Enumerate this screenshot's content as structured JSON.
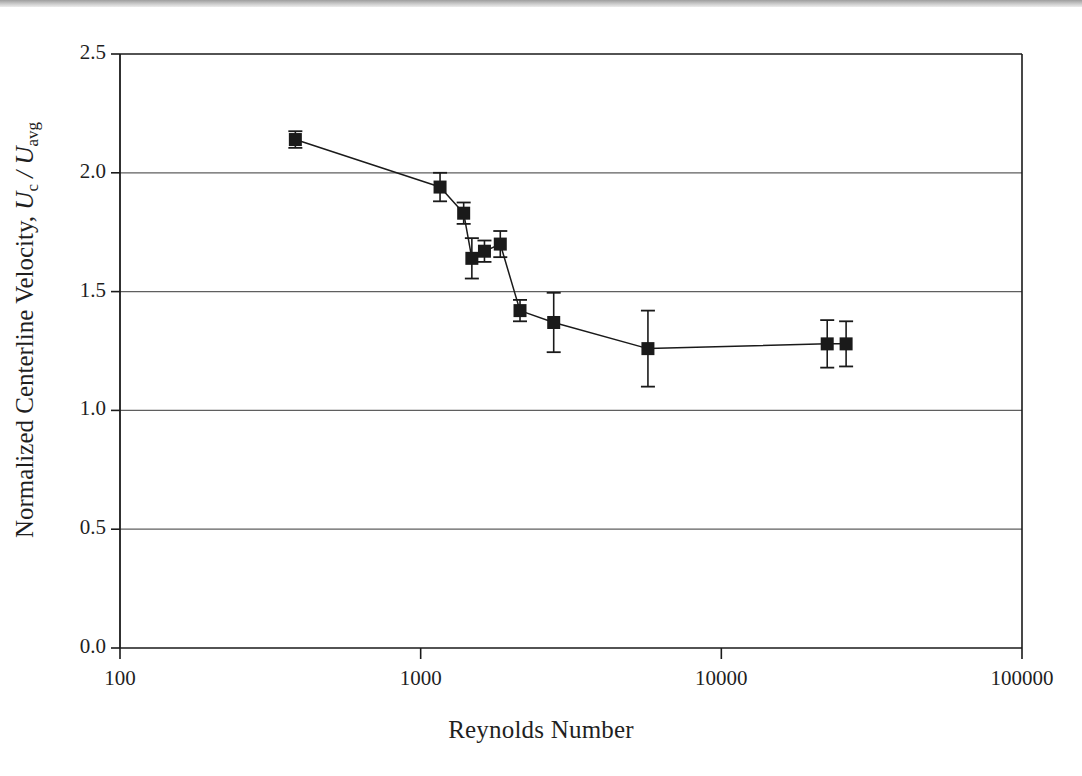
{
  "figure": {
    "background_color": "#ffffff",
    "ink_color": "#1a1a1a",
    "gridline_color": "#5f5f5f"
  },
  "axes": {
    "x_title": "Reynolds Number",
    "y_title_prefix": "Normalized Centerline Velocity, ",
    "y_title_symbol_u": "U",
    "y_title_sub_c": "c",
    "y_title_slash": " / ",
    "y_title_symbol_u2": "U",
    "y_title_sub_avg": "avg",
    "x_ticks": [
      "100",
      "1000",
      "10000",
      "100000"
    ],
    "y_ticks": [
      "2.5",
      "2.0",
      "1.5",
      "1.0",
      "0.5",
      "0.0"
    ]
  },
  "chart_data": {
    "type": "scatter",
    "title": "",
    "xlabel": "Reynolds Number",
    "ylabel": "Normalized Centerline Velocity, Uc/Uavg",
    "xscale": "log",
    "yscale": "linear",
    "xlim": [
      100,
      100000
    ],
    "ylim": [
      0.0,
      2.5
    ],
    "xticks": [
      100,
      1000,
      10000,
      100000
    ],
    "yticks": [
      0.0,
      0.5,
      1.0,
      1.5,
      2.0,
      2.5
    ],
    "grid": "horizontal",
    "legend": "none",
    "marker": "filled-square",
    "connected": true,
    "error_bars": "vertical",
    "series": [
      {
        "name": "Normalized centerline velocity",
        "points": [
          {
            "x": 383,
            "y": 2.14,
            "yerr": 0.035
          },
          {
            "x": 1160,
            "y": 1.94,
            "yerr": 0.06
          },
          {
            "x": 1390,
            "y": 1.83,
            "yerr": 0.045
          },
          {
            "x": 1480,
            "y": 1.64,
            "yerr": 0.085
          },
          {
            "x": 1630,
            "y": 1.67,
            "yerr": 0.045
          },
          {
            "x": 1840,
            "y": 1.7,
            "yerr": 0.055
          },
          {
            "x": 2140,
            "y": 1.42,
            "yerr": 0.045
          },
          {
            "x": 2770,
            "y": 1.37,
            "yerr": 0.125
          },
          {
            "x": 5700,
            "y": 1.26,
            "yerr": 0.16
          },
          {
            "x": 22500,
            "y": 1.28,
            "yerr": 0.1
          },
          {
            "x": 26000,
            "y": 1.28,
            "yerr": 0.095
          }
        ]
      }
    ]
  },
  "plot_geometry": {
    "left_px": 120,
    "right_px": 1022,
    "top_px": 54,
    "bottom_px": 648
  }
}
